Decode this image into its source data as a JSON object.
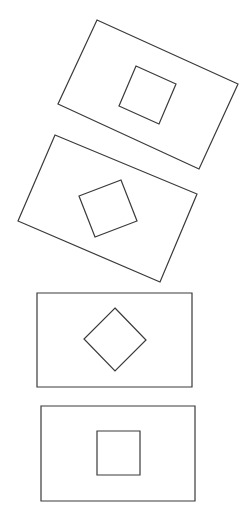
{
  "diagram": {
    "stroke_color": "#3a3a3a",
    "background": "#ffffff",
    "figures": [
      {
        "id": "figure-1",
        "orientation": "rectangle rotated ~25deg clockwise, inner square rotated with it",
        "outer": "97,20 238,84 199,169 58,104",
        "inner": "136,66 176,84 159,124 119,106"
      },
      {
        "id": "figure-2",
        "orientation": "rectangle rotated ~25deg clockwise, inner square rotated opposite (~-20deg)",
        "outer": "55,135 197,194 160,282 18,221",
        "inner": "79,196 121,180 137,221 95,237"
      },
      {
        "id": "figure-3",
        "orientation": "upright rectangle, inner square rotated 45deg (diamond)",
        "outer": "37,293 192,293 192,387 37,387",
        "inner": "115,308 146,340 115,371 84,339"
      },
      {
        "id": "figure-4",
        "orientation": "upright rectangle, upright inner square",
        "outer": "41,406 195,406 195,501 41,501",
        "inner": "97,431 140,431 140,475 97,475"
      }
    ]
  }
}
